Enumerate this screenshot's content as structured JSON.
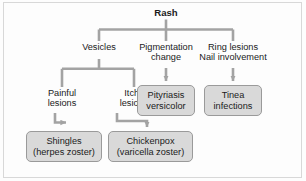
{
  "diagram": {
    "title": "Rash",
    "type": "clinical-differential-flowchart",
    "colors": {
      "connector": "#a3a3a3",
      "box_fill": "#d9d9d9",
      "box_border": "#9a9a9a",
      "text": "#1b1b1b",
      "frame": "#d8d8d8",
      "background": "#fdfdfd"
    },
    "nodes": {
      "root": {
        "label": "Rash",
        "style": "plain-bold"
      },
      "vesicles": {
        "label": "Vesicles",
        "style": "plain"
      },
      "pigmentation": {
        "line1": "Pigmentation",
        "line2": "change",
        "style": "plain"
      },
      "ring_nail": {
        "line1": "Ring lesions",
        "line2": "Nail involvement",
        "style": "plain"
      },
      "painful": {
        "line1": "Painful",
        "line2": "lesions",
        "style": "plain"
      },
      "itchy": {
        "line1": "Itchy",
        "line2": "lesions",
        "style": "plain"
      },
      "pityriasis": {
        "line1": "Pityriasis",
        "line2": "versicolor",
        "style": "boxed"
      },
      "tinea": {
        "line1": "Tinea",
        "line2": "infections",
        "style": "boxed"
      },
      "shingles": {
        "line1": "Shingles",
        "line2": "(herpes zoster)",
        "style": "boxed"
      },
      "chickenpox": {
        "line1": "Chickenpox",
        "line2": "(varicella zoster)",
        "style": "boxed"
      }
    },
    "edges": [
      {
        "from": "root",
        "to": "vesicles",
        "kind": "bus-drop"
      },
      {
        "from": "root",
        "to": "pigmentation",
        "kind": "bus-drop"
      },
      {
        "from": "root",
        "to": "ring_nail",
        "kind": "bus-drop"
      },
      {
        "from": "vesicles",
        "to": "painful",
        "kind": "bracket-drop"
      },
      {
        "from": "vesicles",
        "to": "itchy",
        "kind": "bracket-drop"
      },
      {
        "from": "pigmentation",
        "to": "pityriasis",
        "kind": "arrow-down"
      },
      {
        "from": "ring_nail",
        "to": "tinea",
        "kind": "arrow-down"
      },
      {
        "from": "painful",
        "to": "shingles",
        "kind": "arrow-elbow"
      },
      {
        "from": "itchy",
        "to": "chickenpox",
        "kind": "arrow-elbow"
      }
    ]
  }
}
